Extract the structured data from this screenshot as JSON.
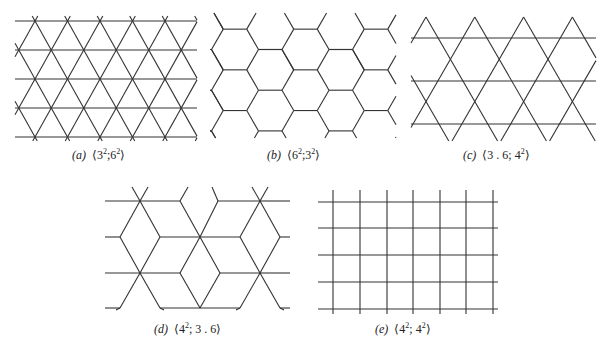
{
  "figure": {
    "panels": [
      {
        "id": "a",
        "label": "(a)",
        "notation_base": [
          "3",
          "6"
        ],
        "notation_exp": [
          "2",
          "2"
        ],
        "separator": ";",
        "caption": "(a) ⟨3²;6²⟩",
        "description": "triangular lattice tiling"
      },
      {
        "id": "b",
        "label": "(b)",
        "notation_base": [
          "6",
          "3"
        ],
        "notation_exp": [
          "2",
          "2"
        ],
        "separator": ";",
        "caption": "(b) ⟨6²;3²⟩",
        "description": "hexagonal (honeycomb) tiling"
      },
      {
        "id": "c",
        "label": "(c)",
        "notation_text_1": "3 . 6; 4",
        "notation_exp": "2",
        "caption": "(c) ⟨3 . 6; 4²⟩",
        "description": "kagome-like tiling of triangles and hexagons"
      },
      {
        "id": "d",
        "label": "(d)",
        "notation_base": "4",
        "notation_exp": "2",
        "notation_rest": "; 3 . 6",
        "caption": "(d) ⟨4²; 3 . 6⟩",
        "description": "rhombus / cube-like tiling"
      },
      {
        "id": "e",
        "label": "(e)",
        "notation_base": [
          "4",
          "4"
        ],
        "notation_exp": [
          "2",
          "2"
        ],
        "separator": "; ",
        "caption": "(e) ⟨4²; 4²⟩",
        "description": "square grid tiling"
      }
    ],
    "line_color": "#333333",
    "background": "#ffffff"
  }
}
